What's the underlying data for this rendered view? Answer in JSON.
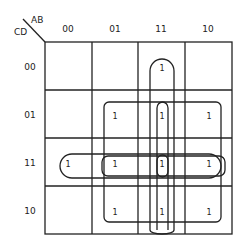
{
  "kmap": {
    "row_var": "CD",
    "col_var": "AB",
    "col_labels": [
      "00",
      "01",
      "11",
      "10"
    ],
    "row_labels": [
      "00",
      "01",
      "11",
      "10"
    ],
    "cells": [
      [
        "",
        "",
        "1",
        ""
      ],
      [
        "",
        "1",
        "1",
        "1"
      ],
      [
        "1",
        "1",
        "1",
        "1"
      ],
      [
        "",
        "1",
        "1",
        "1"
      ]
    ],
    "groups": [
      {
        "name": "col-11-all-rows",
        "desc": "AB=11, CD=00..10"
      },
      {
        "name": "col-11-rows-01-10",
        "desc": "AB=11, CD=01..10"
      },
      {
        "name": "row-11-all-cols",
        "desc": "CD=11, AB=00..10"
      },
      {
        "name": "row-11-cols-01-10",
        "desc": "CD=11, AB=01..10"
      },
      {
        "name": "block-cols-01-10-rows-01-10",
        "desc": "AB=01..10, CD=01..10"
      },
      {
        "name": "single-11-11",
        "desc": "AB=11, CD=11"
      }
    ],
    "colors": {
      "line": "#222222",
      "background": "#ffffff"
    }
  }
}
